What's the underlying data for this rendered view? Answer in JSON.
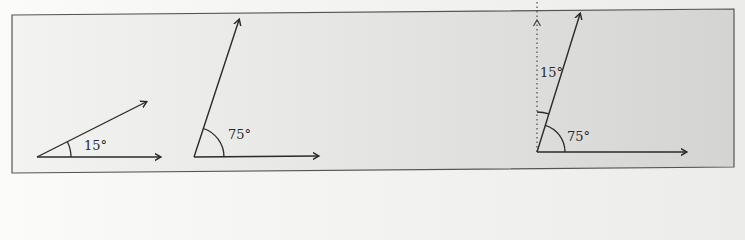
{
  "figure": {
    "background_left": "#f3f3f1",
    "background_right": "#d6d6d4",
    "stroke_color": "#2a2a2a",
    "border_color": "#555555",
    "diagrams": [
      {
        "id": "angle-15",
        "angle_deg": 15,
        "label": "15°"
      },
      {
        "id": "angle-75",
        "angle_deg": 75,
        "label": "75°"
      },
      {
        "id": "angle-75-with-vertical",
        "angle_deg": 75,
        "label": "75°",
        "complement_label": "15°",
        "reference_line": "dotted vertical"
      }
    ]
  }
}
